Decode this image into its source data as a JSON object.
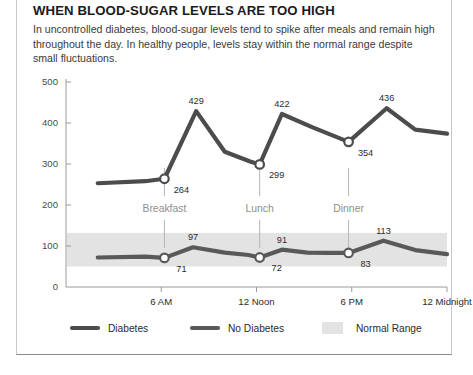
{
  "card": {
    "headline": "WHEN BLOOD-SUGAR LEVELS ARE TOO HIGH",
    "subhead": "In uncontrolled diabetes, blood-sugar levels tend to spike after meals and remain high throughout the day. In healthy people, levels stay within the normal range despite small fluctuations."
  },
  "colors": {
    "diabetes_line": "#4c4c4c",
    "no_diabetes_line": "#595959",
    "normal_range_band": "#e3e3e3",
    "axis": "#9a9a9a",
    "meal_guide": "#b5b5b5",
    "text": "#2b2b2b",
    "muted_text": "#8e8e8e",
    "card_border": "#c9c9c9"
  },
  "chart_data": {
    "type": "line",
    "title": "WHEN BLOOD-SUGAR LEVELS ARE TOO HIGH",
    "xlabel": "",
    "ylabel": "",
    "ylim": [
      0,
      500
    ],
    "xlim": [
      0,
      24
    ],
    "grid": false,
    "legend_position": "bottom",
    "yticks": [
      0,
      100,
      200,
      300,
      400,
      500
    ],
    "ytick_labels": [
      "0",
      "100",
      "200",
      "300",
      "400",
      "500"
    ],
    "xticks": [
      6,
      12,
      18,
      24
    ],
    "xtick_labels": [
      "6 AM",
      "12 Noon",
      "6 PM",
      "12 Midnight"
    ],
    "series": [
      {
        "name": "Diabetes",
        "color": "#4c4c4c",
        "x": [
          2.0,
          5.0,
          6.2,
          8.2,
          10.0,
          11.6,
          12.2,
          13.6,
          15.5,
          17.8,
          20.2,
          22.0,
          24.0
        ],
        "values": [
          253,
          258,
          264,
          429,
          330,
          306,
          299,
          422,
          390,
          354,
          436,
          384,
          374
        ],
        "markers": [
          {
            "x": 6.2,
            "value": 264,
            "label": "264",
            "label_pos": "below-right"
          },
          {
            "x": 12.2,
            "value": 299,
            "label": "299",
            "label_pos": "below-right"
          },
          {
            "x": 17.8,
            "value": 354,
            "label": "354",
            "label_pos": "below-right"
          }
        ],
        "peak_labels": [
          {
            "x": 8.2,
            "value": 429,
            "label": "429"
          },
          {
            "x": 13.6,
            "value": 422,
            "label": "422"
          },
          {
            "x": 20.2,
            "value": 436,
            "label": "436"
          }
        ]
      },
      {
        "name": "No Diabetes",
        "color": "#595959",
        "x": [
          2.0,
          5.0,
          6.2,
          8.0,
          10.0,
          11.5,
          12.2,
          13.6,
          15.2,
          16.6,
          17.8,
          20.0,
          22.0,
          24.0
        ],
        "values": [
          72,
          74,
          71,
          97,
          84,
          78,
          72,
          91,
          84,
          83,
          83,
          113,
          90,
          80
        ],
        "markers": [
          {
            "x": 6.2,
            "value": 71,
            "label": "71",
            "label_pos": "below-right"
          },
          {
            "x": 12.2,
            "value": 72,
            "label": "72",
            "label_pos": "below-right"
          },
          {
            "x": 17.8,
            "value": 83,
            "label": "83",
            "label_pos": "below-right"
          }
        ],
        "peak_labels": [
          {
            "x": 8.0,
            "value": 97,
            "label": "97"
          },
          {
            "x": 13.6,
            "value": 91,
            "label": "91"
          },
          {
            "x": 20.0,
            "value": 113,
            "label": "113"
          }
        ]
      }
    ],
    "bands": [
      {
        "name": "Normal Range",
        "y_low": 50,
        "y_high": 132,
        "color": "#e3e3e3"
      }
    ],
    "annotations": [
      {
        "label": "Breakfast",
        "x": 6.2
      },
      {
        "label": "Lunch",
        "x": 12.2
      },
      {
        "label": "Dinner",
        "x": 17.8
      }
    ]
  },
  "legend": {
    "items": [
      {
        "label": "Diabetes",
        "swatch": "line",
        "color": "#4c4c4c"
      },
      {
        "label": "No Diabetes",
        "swatch": "line",
        "color": "#595959"
      },
      {
        "label": "Normal Range",
        "swatch": "box",
        "color": "#e3e3e3"
      }
    ]
  }
}
